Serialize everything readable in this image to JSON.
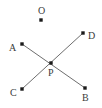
{
  "figure": {
    "width": 102,
    "height": 108,
    "background_color": "#ffffff",
    "line_color": "#6e6e6e",
    "point_color": "#1a1a1a",
    "label_color": "#3b3b3b",
    "line_width": 1,
    "point_size": 3.4
  },
  "points": [
    {
      "id": "O",
      "label": "O",
      "x": 41,
      "y": 20,
      "label_x": 38,
      "label_y": 6,
      "label_position": "above",
      "on_segment": false
    },
    {
      "id": "A",
      "label": "A",
      "x": 22,
      "y": 44,
      "label_x": 9,
      "label_y": 43,
      "label_position": "left",
      "on_segment": true
    },
    {
      "id": "D",
      "label": "D",
      "x": 83,
      "y": 33,
      "label_x": 88,
      "label_y": 31,
      "label_position": "right",
      "on_segment": true
    },
    {
      "id": "P",
      "label": "P",
      "x": 51,
      "y": 63,
      "label_x": 48,
      "label_y": 68,
      "label_position": "below",
      "on_segment": true
    },
    {
      "id": "C",
      "label": "C",
      "x": 22,
      "y": 89,
      "label_x": 10,
      "label_y": 88,
      "label_position": "left",
      "on_segment": true
    },
    {
      "id": "B",
      "label": "B",
      "x": 85,
      "y": 88,
      "label_x": 82,
      "label_y": 93,
      "label_position": "below",
      "on_segment": true
    }
  ],
  "segments": [
    {
      "id": "AB",
      "from": "A",
      "to": "B",
      "x1": 22,
      "y1": 44,
      "x2": 85,
      "y2": 88
    },
    {
      "id": "CD",
      "from": "C",
      "to": "D",
      "x1": 22,
      "y1": 89,
      "x2": 83,
      "y2": 33
    }
  ],
  "intersection": {
    "point_id": "P",
    "of_segments": [
      "AB",
      "CD"
    ]
  }
}
